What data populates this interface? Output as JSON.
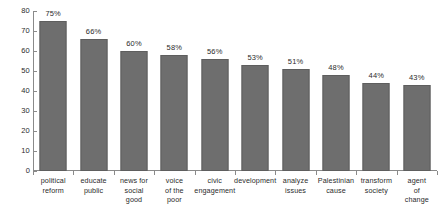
{
  "chart_data": {
    "type": "bar",
    "title": "",
    "subtitle": "",
    "xlabel": "",
    "ylabel": "",
    "ylim": [
      0,
      80
    ],
    "ytick_step": 10,
    "yticks": [
      "80",
      "70",
      "60",
      "50",
      "40",
      "30",
      "20",
      "10",
      "0"
    ],
    "grid": false,
    "legend": null,
    "bar_color": "#6e6e6e",
    "axis_color": "#8a8a8a",
    "text_color": "#2b2b2b",
    "categories": [
      "political reform",
      "educate public",
      "news for social good",
      "voice of the poor",
      "civic engagement",
      "development",
      "analyze issues",
      "Palestinian cause",
      "transform society",
      "agent of change"
    ],
    "category_lines": [
      [
        "political",
        "reform"
      ],
      [
        "educate",
        "public"
      ],
      [
        "news for",
        "social",
        "good"
      ],
      [
        "voice",
        "of the",
        "poor"
      ],
      [
        "civic",
        "engagement"
      ],
      [
        "development"
      ],
      [
        "analyze",
        "issues"
      ],
      [
        "Palestinian",
        "cause"
      ],
      [
        "transform",
        "society"
      ],
      [
        "agent",
        "of",
        "change"
      ]
    ],
    "values": [
      75,
      66,
      60,
      58,
      56,
      53,
      51,
      48,
      44,
      43
    ],
    "data_labels": [
      "75%",
      "66%",
      "60%",
      "58%",
      "56%",
      "53%",
      "51%",
      "48%",
      "44%",
      "43%"
    ]
  }
}
